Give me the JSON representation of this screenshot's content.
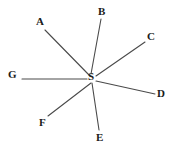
{
  "diagram": {
    "type": "radial-star-node-diagram",
    "width": 175,
    "height": 154,
    "background_color": "#ffffff",
    "line_color": "#4a4a4a",
    "text_color": "#1a1a1a",
    "center": {
      "id": "S",
      "label": "S",
      "label_x": 88,
      "label_y": 71,
      "hub_x": 92,
      "hub_y": 80
    },
    "spokes": [
      {
        "id": "A",
        "label": "A",
        "label_x": 36,
        "label_y": 16,
        "line_x1": 45,
        "line_y1": 30,
        "line_x2": 90,
        "line_y2": 76
      },
      {
        "id": "B",
        "label": "B",
        "label_x": 98,
        "label_y": 6,
        "line_x1": 101,
        "line_y1": 19,
        "line_x2": 91,
        "line_y2": 74
      },
      {
        "id": "C",
        "label": "C",
        "label_x": 147,
        "label_y": 31,
        "line_x1": 145,
        "line_y1": 42,
        "line_x2": 96,
        "line_y2": 76
      },
      {
        "id": "D",
        "label": "D",
        "label_x": 157,
        "label_y": 88,
        "line_x1": 155,
        "line_y1": 94,
        "line_x2": 96,
        "line_y2": 81
      },
      {
        "id": "E",
        "label": "E",
        "label_x": 96,
        "label_y": 132,
        "line_x1": 99,
        "line_y1": 130,
        "line_x2": 92,
        "line_y2": 83
      },
      {
        "id": "F",
        "label": "F",
        "label_x": 39,
        "label_y": 117,
        "line_x1": 48,
        "line_y1": 116,
        "line_x2": 91,
        "line_y2": 83
      },
      {
        "id": "G",
        "label": "G",
        "label_x": 8,
        "label_y": 69,
        "line_x1": 22,
        "line_y1": 79,
        "line_x2": 87,
        "line_y2": 79
      }
    ]
  }
}
